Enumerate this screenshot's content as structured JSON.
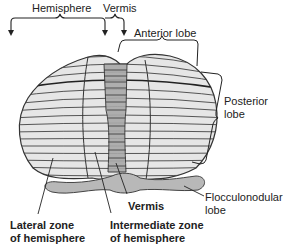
{
  "diagram": {
    "labels": {
      "hemisphere": "Hemisphere",
      "vermis_top": "Vermis",
      "anterior_lobe": "Anterior lobe",
      "posterior_lobe_1": "Posterior",
      "posterior_lobe_2": "lobe",
      "flocculonodular_1": "Flocculonodular",
      "flocculonodular_2": "lobe",
      "vermis_bottom": "Vermis",
      "lateral_zone_1": "Lateral zone",
      "lateral_zone_2": "of hemisphere",
      "intermediate_zone_1": "Intermediate zone",
      "intermediate_zone_2": "of hemisphere"
    },
    "colors": {
      "hemisphere_fill": "#e6e6e6",
      "vermis_fill": "#a9a9a9",
      "flocculonodular_fill": "#b8b8b8",
      "outline": "#333333",
      "folia_line": "#444444"
    }
  }
}
